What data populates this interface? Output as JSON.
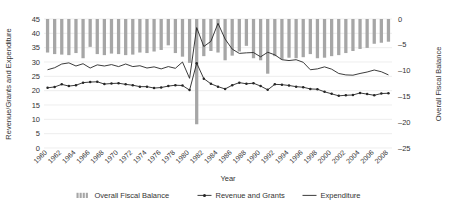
{
  "chart_data": {
    "type": "bar",
    "title": "",
    "subtitle": "",
    "xlabel": "Year",
    "ylabel": "Revenue/Grants and Expenditure",
    "y2label": "Overall Fiscal Balance",
    "ylim": [
      0,
      45
    ],
    "y2lim": [
      -25,
      0
    ],
    "yticks": [
      0,
      5,
      10,
      15,
      20,
      25,
      30,
      35,
      40,
      45
    ],
    "y2ticks": [
      0,
      -5,
      -10,
      -15,
      -20,
      -25
    ],
    "ytick_labels": [
      "0",
      "5",
      "10",
      "15",
      "20",
      "25",
      "30",
      "35",
      "40",
      "45"
    ],
    "y2tick_labels": [
      "0",
      "–5",
      "–10",
      "–15",
      "–20",
      "–25"
    ],
    "grid": true,
    "legend_position": "bottom",
    "x": [
      1960,
      1961,
      1962,
      1963,
      1964,
      1965,
      1966,
      1967,
      1968,
      1969,
      1970,
      1971,
      1972,
      1973,
      1974,
      1975,
      1976,
      1977,
      1978,
      1979,
      1980,
      1981,
      1982,
      1983,
      1984,
      1985,
      1986,
      1987,
      1988,
      1989,
      1990,
      1991,
      1992,
      1993,
      1994,
      1995,
      1996,
      1997,
      1998,
      1999,
      2000,
      2001,
      2002,
      2003,
      2004,
      2005,
      2006,
      2007,
      2008
    ],
    "xtick_labels": [
      "1960",
      "1962",
      "1964",
      "1966",
      "1968",
      "1970",
      "1972",
      "1974",
      "1976",
      "1978",
      "1980",
      "1982",
      "1984",
      "1986",
      "1988",
      "1990",
      "1992",
      "1994",
      "1996",
      "1998",
      "2000",
      "2002",
      "2004",
      "2006",
      "2008"
    ],
    "xtick_step": 2,
    "series": [
      {
        "name": "Overall Fiscal Balance",
        "type": "bar",
        "axis": "right",
        "color": "#a6a6a6",
        "values": [
          -6.5,
          -6.8,
          -6.9,
          -7.0,
          -6.6,
          -7.6,
          -5.4,
          -6.8,
          -7.0,
          -6.7,
          -6.8,
          -7.0,
          -6.9,
          -6.5,
          -6.6,
          -6.3,
          -6.0,
          -5.1,
          -6.6,
          -7.3,
          -8.5,
          -20.4,
          -7.2,
          -6.2,
          -6.5,
          -8.0,
          -7.1,
          -6.3,
          -5.2,
          -7.6,
          -8.0,
          -10.6,
          -7.2,
          -7.8,
          -7.5,
          -7.6,
          -7.4,
          -6.8,
          -7.6,
          -7.5,
          -7.2,
          -7.0,
          -6.6,
          -6.2,
          -5.8,
          -5.6,
          -4.8,
          -4.6,
          -4.4
        ]
      },
      {
        "name": "Revenue and Grants",
        "type": "line",
        "axis": "left",
        "color": "#262626",
        "marker": "circle",
        "values": [
          21.0,
          21.3,
          22.2,
          21.6,
          21.9,
          22.8,
          23.0,
          23.1,
          22.3,
          22.5,
          22.6,
          22.2,
          21.9,
          21.4,
          21.4,
          20.9,
          21.1,
          21.6,
          21.9,
          21.8,
          20.2,
          29.6,
          24.2,
          22.4,
          21.4,
          20.6,
          21.9,
          22.8,
          22.4,
          22.6,
          21.6,
          20.3,
          22.2,
          22.1,
          21.8,
          21.4,
          21.2,
          20.6,
          20.5,
          19.6,
          18.9,
          18.2,
          18.4,
          18.5,
          19.2,
          18.8,
          18.4,
          19.0,
          19.1
        ]
      },
      {
        "name": "Expenditure",
        "type": "line",
        "axis": "left",
        "color": "#262626",
        "marker": "none",
        "values": [
          27.3,
          28.0,
          29.3,
          29.7,
          28.6,
          29.4,
          27.9,
          29.0,
          28.6,
          29.1,
          28.4,
          29.3,
          28.4,
          28.7,
          27.9,
          28.3,
          27.6,
          28.4,
          27.8,
          30.0,
          24.3,
          42.0,
          35.4,
          37.2,
          43.5,
          38.0,
          34.5,
          33.0,
          33.2,
          33.3,
          31.8,
          33.4,
          32.5,
          30.8,
          30.5,
          30.8,
          29.9,
          27.3,
          27.6,
          28.3,
          27.5,
          26.0,
          25.5,
          25.4,
          26.0,
          26.5,
          27.2,
          26.6,
          25.5
        ]
      }
    ],
    "legend": [
      {
        "label": "Overall Fiscal Balance",
        "marker": "bar",
        "color": "#a6a6a6"
      },
      {
        "label": "Revenue and Grants",
        "marker": "line-dot",
        "color": "#262626"
      },
      {
        "label": "Expenditure",
        "marker": "line",
        "color": "#262626"
      }
    ]
  }
}
